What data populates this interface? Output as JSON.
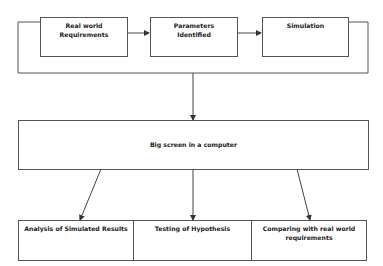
{
  "diagram": {
    "top_row": [
      {
        "id": "real-world-requirements",
        "label_line1": "Real world",
        "label_line2": "Requirements"
      },
      {
        "id": "parameters-identified",
        "label_line1": "Parameters",
        "label_line2": "Identified"
      },
      {
        "id": "simulation",
        "label_line1": "Simulation",
        "label_line2": ""
      }
    ],
    "center": {
      "id": "big-screen",
      "label": "Big screen in a computer"
    },
    "bottom_row": [
      {
        "id": "analysis",
        "label_line1": "Analysis of Simulated Results",
        "label_line2": ""
      },
      {
        "id": "testing",
        "label_line1": "Testing of Hypothesis",
        "label_line2": ""
      },
      {
        "id": "comparing",
        "label_line1": "Comparing with real world",
        "label_line2": "requirements"
      }
    ],
    "edges": [
      {
        "from": "real-world-requirements",
        "to": "parameters-identified"
      },
      {
        "from": "parameters-identified",
        "to": "simulation"
      },
      {
        "from": "loop",
        "to": "big-screen"
      },
      {
        "from": "big-screen",
        "to": "analysis"
      },
      {
        "from": "big-screen",
        "to": "testing"
      },
      {
        "from": "big-screen",
        "to": "comparing"
      }
    ],
    "colors": {
      "line": "#444444",
      "box_border": "#555555",
      "text": "#222222"
    }
  }
}
